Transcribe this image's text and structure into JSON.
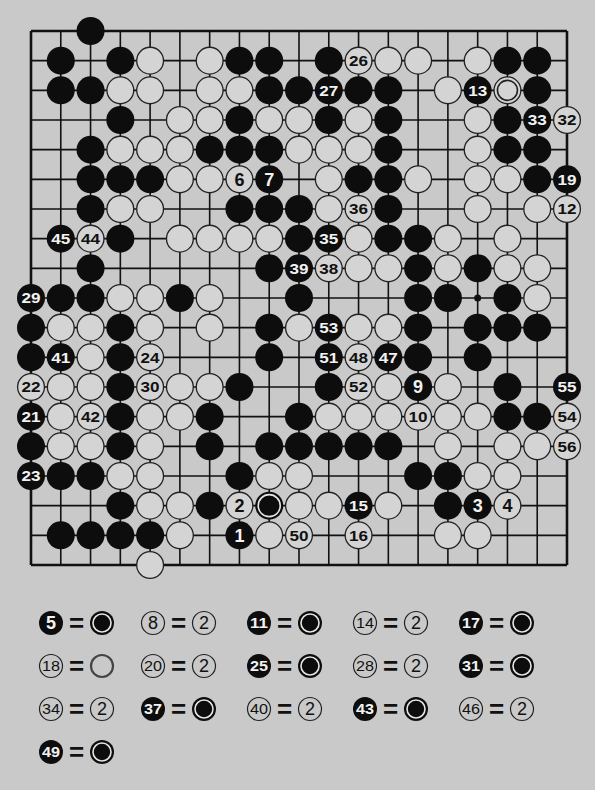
{
  "diagram": {
    "board_size": 19,
    "grid": {
      "x0": 31,
      "y0": 31,
      "x1": 567,
      "y1": 565
    },
    "colors": {
      "background": "#c9c9c9",
      "line": "#111111",
      "black": "#0d0d0d",
      "white": "#d4d4d4"
    },
    "hoshi": [
      [
        15,
        9
      ]
    ],
    "stones": [
      {
        "c": 2,
        "r": 0,
        "color": "B"
      },
      {
        "c": 1,
        "r": 1,
        "color": "B"
      },
      {
        "c": 3,
        "r": 1,
        "color": "B"
      },
      {
        "c": 4,
        "r": 1,
        "color": "W"
      },
      {
        "c": 6,
        "r": 1,
        "color": "W"
      },
      {
        "c": 7,
        "r": 1,
        "color": "B"
      },
      {
        "c": 8,
        "r": 1,
        "color": "B"
      },
      {
        "c": 10,
        "r": 1,
        "color": "B"
      },
      {
        "c": 11,
        "r": 1,
        "color": "W",
        "label": "26"
      },
      {
        "c": 12,
        "r": 1,
        "color": "W"
      },
      {
        "c": 13,
        "r": 1,
        "color": "W"
      },
      {
        "c": 15,
        "r": 1,
        "color": "W"
      },
      {
        "c": 16,
        "r": 1,
        "color": "B"
      },
      {
        "c": 17,
        "r": 1,
        "color": "B"
      },
      {
        "c": 1,
        "r": 2,
        "color": "B"
      },
      {
        "c": 2,
        "r": 2,
        "color": "B"
      },
      {
        "c": 3,
        "r": 2,
        "color": "W"
      },
      {
        "c": 4,
        "r": 2,
        "color": "W"
      },
      {
        "c": 6,
        "r": 2,
        "color": "W"
      },
      {
        "c": 7,
        "r": 2,
        "color": "W"
      },
      {
        "c": 8,
        "r": 2,
        "color": "B"
      },
      {
        "c": 9,
        "r": 2,
        "color": "B"
      },
      {
        "c": 10,
        "r": 2,
        "color": "B",
        "label": "27"
      },
      {
        "c": 11,
        "r": 2,
        "color": "B"
      },
      {
        "c": 12,
        "r": 2,
        "color": "B"
      },
      {
        "c": 14,
        "r": 2,
        "color": "W"
      },
      {
        "c": 15,
        "r": 2,
        "color": "B",
        "label": "13"
      },
      {
        "c": 16,
        "r": 2,
        "color": "W",
        "marked": true
      },
      {
        "c": 17,
        "r": 2,
        "color": "B"
      },
      {
        "c": 3,
        "r": 3,
        "color": "B"
      },
      {
        "c": 5,
        "r": 3,
        "color": "W"
      },
      {
        "c": 6,
        "r": 3,
        "color": "W"
      },
      {
        "c": 7,
        "r": 3,
        "color": "B"
      },
      {
        "c": 8,
        "r": 3,
        "color": "W"
      },
      {
        "c": 9,
        "r": 3,
        "color": "W"
      },
      {
        "c": 10,
        "r": 3,
        "color": "B"
      },
      {
        "c": 11,
        "r": 3,
        "color": "W"
      },
      {
        "c": 12,
        "r": 3,
        "color": "B"
      },
      {
        "c": 15,
        "r": 3,
        "color": "W"
      },
      {
        "c": 16,
        "r": 3,
        "color": "B"
      },
      {
        "c": 17,
        "r": 3,
        "color": "B",
        "label": "33"
      },
      {
        "c": 18,
        "r": 3,
        "color": "W",
        "label": "32"
      },
      {
        "c": 2,
        "r": 4,
        "color": "B"
      },
      {
        "c": 3,
        "r": 4,
        "color": "W"
      },
      {
        "c": 4,
        "r": 4,
        "color": "W"
      },
      {
        "c": 5,
        "r": 4,
        "color": "W"
      },
      {
        "c": 6,
        "r": 4,
        "color": "B"
      },
      {
        "c": 7,
        "r": 4,
        "color": "B"
      },
      {
        "c": 8,
        "r": 4,
        "color": "B"
      },
      {
        "c": 9,
        "r": 4,
        "color": "W"
      },
      {
        "c": 10,
        "r": 4,
        "color": "W"
      },
      {
        "c": 11,
        "r": 4,
        "color": "W"
      },
      {
        "c": 12,
        "r": 4,
        "color": "B"
      },
      {
        "c": 15,
        "r": 4,
        "color": "W"
      },
      {
        "c": 16,
        "r": 4,
        "color": "B"
      },
      {
        "c": 17,
        "r": 4,
        "color": "B"
      },
      {
        "c": 2,
        "r": 5,
        "color": "B"
      },
      {
        "c": 3,
        "r": 5,
        "color": "B"
      },
      {
        "c": 4,
        "r": 5,
        "color": "B"
      },
      {
        "c": 5,
        "r": 5,
        "color": "W"
      },
      {
        "c": 6,
        "r": 5,
        "color": "W"
      },
      {
        "c": 7,
        "r": 5,
        "color": "W",
        "label": "6"
      },
      {
        "c": 8,
        "r": 5,
        "color": "B",
        "label": "7"
      },
      {
        "c": 10,
        "r": 5,
        "color": "W"
      },
      {
        "c": 11,
        "r": 5,
        "color": "B"
      },
      {
        "c": 12,
        "r": 5,
        "color": "B"
      },
      {
        "c": 13,
        "r": 5,
        "color": "W"
      },
      {
        "c": 15,
        "r": 5,
        "color": "W"
      },
      {
        "c": 16,
        "r": 5,
        "color": "W"
      },
      {
        "c": 17,
        "r": 5,
        "color": "B"
      },
      {
        "c": 18,
        "r": 5,
        "color": "B",
        "label": "19"
      },
      {
        "c": 2,
        "r": 6,
        "color": "B"
      },
      {
        "c": 3,
        "r": 6,
        "color": "W"
      },
      {
        "c": 4,
        "r": 6,
        "color": "W"
      },
      {
        "c": 7,
        "r": 6,
        "color": "B"
      },
      {
        "c": 8,
        "r": 6,
        "color": "B"
      },
      {
        "c": 9,
        "r": 6,
        "color": "B"
      },
      {
        "c": 10,
        "r": 6,
        "color": "W"
      },
      {
        "c": 11,
        "r": 6,
        "color": "W",
        "label": "36"
      },
      {
        "c": 12,
        "r": 6,
        "color": "B"
      },
      {
        "c": 15,
        "r": 6,
        "color": "W"
      },
      {
        "c": 17,
        "r": 6,
        "color": "W"
      },
      {
        "c": 18,
        "r": 6,
        "color": "W",
        "label": "12"
      },
      {
        "c": 1,
        "r": 7,
        "color": "B",
        "label": "45"
      },
      {
        "c": 2,
        "r": 7,
        "color": "W",
        "label": "44"
      },
      {
        "c": 3,
        "r": 7,
        "color": "B"
      },
      {
        "c": 5,
        "r": 7,
        "color": "W"
      },
      {
        "c": 6,
        "r": 7,
        "color": "W"
      },
      {
        "c": 7,
        "r": 7,
        "color": "W"
      },
      {
        "c": 8,
        "r": 7,
        "color": "W"
      },
      {
        "c": 9,
        "r": 7,
        "color": "B"
      },
      {
        "c": 10,
        "r": 7,
        "color": "B",
        "label": "35"
      },
      {
        "c": 11,
        "r": 7,
        "color": "W"
      },
      {
        "c": 12,
        "r": 7,
        "color": "B"
      },
      {
        "c": 13,
        "r": 7,
        "color": "B"
      },
      {
        "c": 14,
        "r": 7,
        "color": "W"
      },
      {
        "c": 16,
        "r": 7,
        "color": "W"
      },
      {
        "c": 2,
        "r": 8,
        "color": "B"
      },
      {
        "c": 8,
        "r": 8,
        "color": "B"
      },
      {
        "c": 9,
        "r": 8,
        "color": "B",
        "label": "39"
      },
      {
        "c": 10,
        "r": 8,
        "color": "W",
        "label": "38"
      },
      {
        "c": 11,
        "r": 8,
        "color": "W"
      },
      {
        "c": 12,
        "r": 8,
        "color": "W"
      },
      {
        "c": 13,
        "r": 8,
        "color": "B"
      },
      {
        "c": 14,
        "r": 8,
        "color": "W"
      },
      {
        "c": 15,
        "r": 8,
        "color": "B"
      },
      {
        "c": 16,
        "r": 8,
        "color": "W"
      },
      {
        "c": 17,
        "r": 8,
        "color": "W"
      },
      {
        "c": 0,
        "r": 9,
        "color": "B",
        "label": "29"
      },
      {
        "c": 1,
        "r": 9,
        "color": "B"
      },
      {
        "c": 2,
        "r": 9,
        "color": "B"
      },
      {
        "c": 3,
        "r": 9,
        "color": "W"
      },
      {
        "c": 4,
        "r": 9,
        "color": "W"
      },
      {
        "c": 5,
        "r": 9,
        "color": "B"
      },
      {
        "c": 6,
        "r": 9,
        "color": "W"
      },
      {
        "c": 9,
        "r": 9,
        "color": "B"
      },
      {
        "c": 13,
        "r": 9,
        "color": "B"
      },
      {
        "c": 14,
        "r": 9,
        "color": "B"
      },
      {
        "c": 16,
        "r": 9,
        "color": "B"
      },
      {
        "c": 17,
        "r": 9,
        "color": "W"
      },
      {
        "c": 0,
        "r": 10,
        "color": "B"
      },
      {
        "c": 1,
        "r": 10,
        "color": "W"
      },
      {
        "c": 2,
        "r": 10,
        "color": "W"
      },
      {
        "c": 3,
        "r": 10,
        "color": "B"
      },
      {
        "c": 4,
        "r": 10,
        "color": "W"
      },
      {
        "c": 6,
        "r": 10,
        "color": "W"
      },
      {
        "c": 8,
        "r": 10,
        "color": "B"
      },
      {
        "c": 9,
        "r": 10,
        "color": "W"
      },
      {
        "c": 10,
        "r": 10,
        "color": "B",
        "label": "53"
      },
      {
        "c": 11,
        "r": 10,
        "color": "W"
      },
      {
        "c": 12,
        "r": 10,
        "color": "W"
      },
      {
        "c": 13,
        "r": 10,
        "color": "B"
      },
      {
        "c": 15,
        "r": 10,
        "color": "B"
      },
      {
        "c": 16,
        "r": 10,
        "color": "B"
      },
      {
        "c": 17,
        "r": 10,
        "color": "B"
      },
      {
        "c": 0,
        "r": 11,
        "color": "B"
      },
      {
        "c": 1,
        "r": 11,
        "color": "B",
        "label": "41"
      },
      {
        "c": 2,
        "r": 11,
        "color": "W"
      },
      {
        "c": 3,
        "r": 11,
        "color": "B"
      },
      {
        "c": 4,
        "r": 11,
        "color": "W",
        "label": "24"
      },
      {
        "c": 8,
        "r": 11,
        "color": "B"
      },
      {
        "c": 10,
        "r": 11,
        "color": "B",
        "label": "51"
      },
      {
        "c": 11,
        "r": 11,
        "color": "W",
        "label": "48"
      },
      {
        "c": 12,
        "r": 11,
        "color": "B",
        "label": "47"
      },
      {
        "c": 13,
        "r": 11,
        "color": "B"
      },
      {
        "c": 15,
        "r": 11,
        "color": "B"
      },
      {
        "c": 0,
        "r": 12,
        "color": "W",
        "label": "22"
      },
      {
        "c": 1,
        "r": 12,
        "color": "W"
      },
      {
        "c": 2,
        "r": 12,
        "color": "W"
      },
      {
        "c": 3,
        "r": 12,
        "color": "B"
      },
      {
        "c": 4,
        "r": 12,
        "color": "W",
        "label": "30"
      },
      {
        "c": 5,
        "r": 12,
        "color": "W"
      },
      {
        "c": 6,
        "r": 12,
        "color": "W"
      },
      {
        "c": 7,
        "r": 12,
        "color": "B"
      },
      {
        "c": 10,
        "r": 12,
        "color": "B"
      },
      {
        "c": 11,
        "r": 12,
        "color": "W",
        "label": "52"
      },
      {
        "c": 12,
        "r": 12,
        "color": "W"
      },
      {
        "c": 13,
        "r": 12,
        "color": "B",
        "label": "9"
      },
      {
        "c": 14,
        "r": 12,
        "color": "W"
      },
      {
        "c": 16,
        "r": 12,
        "color": "B"
      },
      {
        "c": 18,
        "r": 12,
        "color": "B",
        "label": "55"
      },
      {
        "c": 0,
        "r": 13,
        "color": "B",
        "label": "21"
      },
      {
        "c": 1,
        "r": 13,
        "color": "W"
      },
      {
        "c": 2,
        "r": 13,
        "color": "W",
        "label": "42"
      },
      {
        "c": 3,
        "r": 13,
        "color": "B"
      },
      {
        "c": 4,
        "r": 13,
        "color": "W"
      },
      {
        "c": 5,
        "r": 13,
        "color": "W"
      },
      {
        "c": 6,
        "r": 13,
        "color": "B"
      },
      {
        "c": 9,
        "r": 13,
        "color": "B"
      },
      {
        "c": 10,
        "r": 13,
        "color": "W"
      },
      {
        "c": 11,
        "r": 13,
        "color": "W"
      },
      {
        "c": 12,
        "r": 13,
        "color": "W"
      },
      {
        "c": 13,
        "r": 13,
        "color": "W",
        "label": "10"
      },
      {
        "c": 14,
        "r": 13,
        "color": "W"
      },
      {
        "c": 15,
        "r": 13,
        "color": "W"
      },
      {
        "c": 16,
        "r": 13,
        "color": "B"
      },
      {
        "c": 17,
        "r": 13,
        "color": "B"
      },
      {
        "c": 18,
        "r": 13,
        "color": "W",
        "label": "54"
      },
      {
        "c": 0,
        "r": 14,
        "color": "B"
      },
      {
        "c": 1,
        "r": 14,
        "color": "W"
      },
      {
        "c": 2,
        "r": 14,
        "color": "W"
      },
      {
        "c": 3,
        "r": 14,
        "color": "B"
      },
      {
        "c": 4,
        "r": 14,
        "color": "W"
      },
      {
        "c": 6,
        "r": 14,
        "color": "B"
      },
      {
        "c": 8,
        "r": 14,
        "color": "B"
      },
      {
        "c": 9,
        "r": 14,
        "color": "B"
      },
      {
        "c": 10,
        "r": 14,
        "color": "B"
      },
      {
        "c": 11,
        "r": 14,
        "color": "B"
      },
      {
        "c": 12,
        "r": 14,
        "color": "B"
      },
      {
        "c": 14,
        "r": 14,
        "color": "W"
      },
      {
        "c": 16,
        "r": 14,
        "color": "W"
      },
      {
        "c": 17,
        "r": 14,
        "color": "W"
      },
      {
        "c": 18,
        "r": 14,
        "color": "W",
        "label": "56"
      },
      {
        "c": 0,
        "r": 15,
        "color": "B",
        "label": "23"
      },
      {
        "c": 1,
        "r": 15,
        "color": "B"
      },
      {
        "c": 2,
        "r": 15,
        "color": "B"
      },
      {
        "c": 3,
        "r": 15,
        "color": "W"
      },
      {
        "c": 4,
        "r": 15,
        "color": "W"
      },
      {
        "c": 7,
        "r": 15,
        "color": "B"
      },
      {
        "c": 8,
        "r": 15,
        "color": "W"
      },
      {
        "c": 9,
        "r": 15,
        "color": "W"
      },
      {
        "c": 13,
        "r": 15,
        "color": "B"
      },
      {
        "c": 14,
        "r": 15,
        "color": "B"
      },
      {
        "c": 15,
        "r": 15,
        "color": "W"
      },
      {
        "c": 16,
        "r": 15,
        "color": "W"
      },
      {
        "c": 3,
        "r": 16,
        "color": "B"
      },
      {
        "c": 4,
        "r": 16,
        "color": "W"
      },
      {
        "c": 5,
        "r": 16,
        "color": "W"
      },
      {
        "c": 6,
        "r": 16,
        "color": "B"
      },
      {
        "c": 7,
        "r": 16,
        "color": "W",
        "label": "2"
      },
      {
        "c": 8,
        "r": 16,
        "color": "B",
        "marked": true
      },
      {
        "c": 9,
        "r": 16,
        "color": "W"
      },
      {
        "c": 10,
        "r": 16,
        "color": "W"
      },
      {
        "c": 11,
        "r": 16,
        "color": "B",
        "label": "15"
      },
      {
        "c": 12,
        "r": 16,
        "color": "W"
      },
      {
        "c": 14,
        "r": 16,
        "color": "B"
      },
      {
        "c": 15,
        "r": 16,
        "color": "B",
        "label": "3"
      },
      {
        "c": 16,
        "r": 16,
        "color": "W",
        "label": "4"
      },
      {
        "c": 1,
        "r": 17,
        "color": "B"
      },
      {
        "c": 2,
        "r": 17,
        "color": "B"
      },
      {
        "c": 3,
        "r": 17,
        "color": "B"
      },
      {
        "c": 4,
        "r": 17,
        "color": "B"
      },
      {
        "c": 5,
        "r": 17,
        "color": "W"
      },
      {
        "c": 7,
        "r": 17,
        "color": "B",
        "label": "1"
      },
      {
        "c": 8,
        "r": 17,
        "color": "W"
      },
      {
        "c": 9,
        "r": 17,
        "color": "W",
        "label": "50"
      },
      {
        "c": 11,
        "r": 17,
        "color": "W",
        "label": "16"
      },
      {
        "c": 14,
        "r": 17,
        "color": "W"
      },
      {
        "c": 15,
        "r": 17,
        "color": "W"
      },
      {
        "c": 4,
        "r": 18,
        "color": "W"
      }
    ]
  },
  "legend": {
    "equals_sign": "=",
    "items": [
      {
        "move": "5",
        "move_color": "B",
        "target": "marked-black",
        "target_label": ""
      },
      {
        "move": "8",
        "move_color": "W",
        "target": "white-label",
        "target_label": "2"
      },
      {
        "move": "11",
        "move_color": "B",
        "target": "marked-black",
        "target_label": ""
      },
      {
        "move": "14",
        "move_color": "W",
        "target": "white-label",
        "target_label": "2"
      },
      {
        "move": "17",
        "move_color": "B",
        "target": "marked-black",
        "target_label": ""
      },
      {
        "move": "18",
        "move_color": "W",
        "target": "marked-white",
        "target_label": ""
      },
      {
        "move": "20",
        "move_color": "W",
        "target": "white-label",
        "target_label": "2"
      },
      {
        "move": "25",
        "move_color": "B",
        "target": "marked-black",
        "target_label": ""
      },
      {
        "move": "28",
        "move_color": "W",
        "target": "white-label",
        "target_label": "2"
      },
      {
        "move": "31",
        "move_color": "B",
        "target": "marked-black",
        "target_label": ""
      },
      {
        "move": "34",
        "move_color": "W",
        "target": "white-label",
        "target_label": "2"
      },
      {
        "move": "37",
        "move_color": "B",
        "target": "marked-black",
        "target_label": ""
      },
      {
        "move": "40",
        "move_color": "W",
        "target": "white-label",
        "target_label": "2"
      },
      {
        "move": "43",
        "move_color": "B",
        "target": "marked-black",
        "target_label": ""
      },
      {
        "move": "46",
        "move_color": "W",
        "target": "white-label",
        "target_label": "2"
      },
      {
        "move": "49",
        "move_color": "B",
        "target": "marked-black",
        "target_label": ""
      }
    ]
  }
}
